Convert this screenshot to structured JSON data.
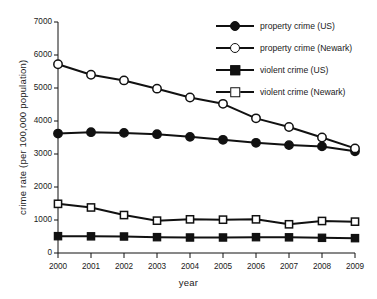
{
  "chart_data": {
    "type": "line",
    "title": "",
    "xlabel": "year",
    "ylabel": "crime rate (per 100,000 population)",
    "categories": [
      2000,
      2001,
      2002,
      2003,
      2004,
      2005,
      2006,
      2007,
      2008,
      2009
    ],
    "x_tick_labels": [
      "2000",
      "2001",
      "2002",
      "2003",
      "2004",
      "2005",
      "2006",
      "2007",
      "2008",
      "2009"
    ],
    "y_tick_labels": [
      "0",
      "1000",
      "2000",
      "3000",
      "4000",
      "5000",
      "6000",
      "7000"
    ],
    "y_ticks": [
      0,
      1000,
      2000,
      3000,
      4000,
      5000,
      6000,
      7000
    ],
    "ylim": [
      0,
      7000
    ],
    "xlim": [
      2000,
      2009
    ],
    "grid": false,
    "legend_position": "top-right",
    "series": [
      {
        "name": "property crime (US)",
        "marker": "circle-filled",
        "color": "#111111",
        "values": [
          3620,
          3660,
          3640,
          3600,
          3520,
          3430,
          3340,
          3270,
          3230,
          3080
        ]
      },
      {
        "name": "property crime (Newark)",
        "marker": "circle-open",
        "color": "#111111",
        "values": [
          5720,
          5400,
          5230,
          4980,
          4710,
          4520,
          4080,
          3820,
          3500,
          3170
        ]
      },
      {
        "name": "violent crime (US)",
        "marker": "square-filled",
        "color": "#111111",
        "values": [
          510,
          505,
          500,
          480,
          470,
          470,
          480,
          475,
          460,
          450
        ]
      },
      {
        "name": "violent crime (Newark)",
        "marker": "square-open",
        "color": "#111111",
        "values": [
          1490,
          1380,
          1150,
          980,
          1020,
          1010,
          1020,
          870,
          970,
          950
        ]
      }
    ]
  },
  "legend": {
    "items": [
      {
        "label": "property crime (US)",
        "marker": "circle-filled"
      },
      {
        "label": "property crime (Newark)",
        "marker": "circle-open"
      },
      {
        "label": "violent crime (US)",
        "marker": "square-filled"
      },
      {
        "label": "violent crime (Newark)",
        "marker": "square-open"
      }
    ]
  },
  "axes": {
    "y_title": "crime rate (per 100,000 population)",
    "x_title": "year"
  }
}
